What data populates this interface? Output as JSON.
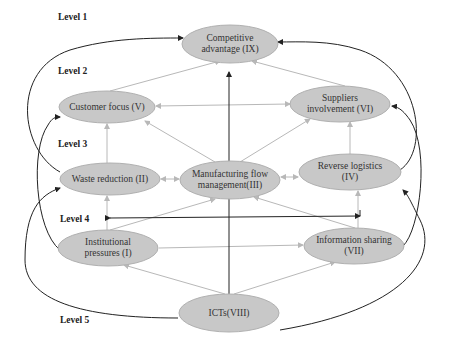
{
  "levels": [
    {
      "label": "Level 1",
      "x": 58,
      "y": 12
    },
    {
      "label": "Level 2",
      "x": 58,
      "y": 66
    },
    {
      "label": "Level 3",
      "x": 58,
      "y": 139
    },
    {
      "label": "Level 4",
      "x": 60,
      "y": 214
    },
    {
      "label": "Level 5",
      "x": 60,
      "y": 315
    }
  ],
  "nodes": [
    {
      "id": "IX",
      "line1": "Competitive",
      "line2": "advantage (IX)",
      "cx": 230,
      "cy": 44,
      "rx": 48,
      "ry": 19
    },
    {
      "id": "V",
      "line1": "Customer focus (V)",
      "line2": "",
      "cx": 107,
      "cy": 107,
      "rx": 48,
      "ry": 16
    },
    {
      "id": "VI",
      "line1": "Suppliers",
      "line2": "involvement (VI)",
      "cx": 340,
      "cy": 104,
      "rx": 50,
      "ry": 18
    },
    {
      "id": "II",
      "line1": "Waste reduction (II)",
      "line2": "",
      "cx": 110,
      "cy": 179,
      "rx": 50,
      "ry": 16
    },
    {
      "id": "III",
      "line1": "Manufacturing flow",
      "line2": "management(III)",
      "cx": 230,
      "cy": 180,
      "rx": 50,
      "ry": 19
    },
    {
      "id": "IV",
      "line1": "Reverse logistics",
      "line2": "(IV)",
      "cx": 350,
      "cy": 172,
      "rx": 51,
      "ry": 18
    },
    {
      "id": "I",
      "line1": "Institutional",
      "line2": "pressures (I)",
      "cx": 108,
      "cy": 248,
      "rx": 50,
      "ry": 18
    },
    {
      "id": "VII",
      "line1": "Information sharing",
      "line2": "(VII)",
      "cx": 354,
      "cy": 246,
      "rx": 50,
      "ry": 18
    },
    {
      "id": "VIII",
      "line1": "ICTs(VIII)",
      "line2": "",
      "cx": 229,
      "cy": 313,
      "rx": 50,
      "ry": 19
    }
  ],
  "edges": {
    "dark": [
      {
        "from": "VIII",
        "to": "IX",
        "style": "vertical-center"
      },
      {
        "from": "IV",
        "to": "IX",
        "style": "curve-right"
      },
      {
        "from": "I",
        "to": "V",
        "style": "curve-left"
      },
      {
        "from": "II",
        "to": "IX",
        "style": "curve-left-outer"
      },
      {
        "from": "VIII",
        "to": "II",
        "style": "curve-left-bottom"
      },
      {
        "from": "VII",
        "to": "VI",
        "style": "curve-right-inner"
      },
      {
        "from": "VIII",
        "to": "IV",
        "style": "curve-right-bottom"
      },
      {
        "from": "level4-bar",
        "to": "both",
        "style": "horizontal-double"
      }
    ],
    "light": [
      {
        "from": "V",
        "to": "IX"
      },
      {
        "from": "VI",
        "to": "IX"
      },
      {
        "from": "V",
        "to": "VI",
        "bidirectional": true
      },
      {
        "from": "III",
        "to": "V"
      },
      {
        "from": "III",
        "to": "VI"
      },
      {
        "from": "II",
        "to": "V"
      },
      {
        "from": "IV",
        "to": "VI"
      },
      {
        "from": "II",
        "to": "III",
        "bidirectional": true
      },
      {
        "from": "III",
        "to": "IV",
        "bidirectional": true
      },
      {
        "from": "I",
        "to": "II"
      },
      {
        "from": "I",
        "to": "III"
      },
      {
        "from": "VII",
        "to": "III"
      },
      {
        "from": "VII",
        "to": "IV"
      },
      {
        "from": "I",
        "to": "VII"
      },
      {
        "from": "VIII",
        "to": "I"
      },
      {
        "from": "VIII",
        "to": "VII"
      }
    ]
  },
  "colors": {
    "node_fill": "#c8c8c8",
    "node_stroke": "#b0b0b0",
    "dark_edge": "#222222",
    "light_edge": "#b8b8b8"
  }
}
